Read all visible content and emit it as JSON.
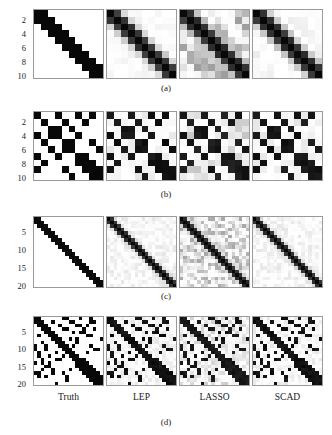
{
  "figure": {
    "title": "",
    "background": "#ffffff",
    "panel_border_color": "#9a9a9a",
    "columns": [
      {
        "id": "truth",
        "label": "Truth"
      },
      {
        "id": "lep",
        "label": "LEP"
      },
      {
        "id": "lasso",
        "label": "LASSO"
      },
      {
        "id": "scad",
        "label": "SCAD"
      }
    ],
    "rows": [
      {
        "id": "a",
        "caption": "(a)",
        "size": 10,
        "yticks": [
          "2",
          "4",
          "6",
          "8",
          "10"
        ],
        "ytickvals": [
          2,
          4,
          6,
          8,
          10
        ]
      },
      {
        "id": "b",
        "caption": "(b)",
        "size": 10,
        "yticks": [
          "2",
          "4",
          "6",
          "8",
          "10"
        ],
        "ytickvals": [
          2,
          4,
          6,
          8,
          10
        ]
      },
      {
        "id": "c",
        "caption": "(c)",
        "size": 20,
        "yticks": [
          "5",
          "10",
          "15",
          "20"
        ],
        "ytickvals": [
          5,
          10,
          15,
          20
        ]
      },
      {
        "id": "d",
        "caption": "(d)",
        "size": 20,
        "yticks": [
          "5",
          "10",
          "15",
          "20"
        ],
        "ytickvals": [
          5,
          10,
          15,
          20
        ]
      }
    ]
  },
  "chart_data": {
    "type": "heatmap",
    "title": "",
    "xlabel": "",
    "ylabel": "",
    "colormap": "grayscale_reversed",
    "value_range": [
      0,
      1
    ],
    "grids": [
      {
        "row": "a",
        "size": 10,
        "structure": "banded_tridiagonal",
        "panels": [
          {
            "column": "Truth",
            "diag": 1.0,
            "offdiag1": 1.0,
            "offdiag2": 0.0,
            "noise": 0.0,
            "noise_max": 0.0
          },
          {
            "column": "LEP",
            "diag": 1.0,
            "offdiag1": 0.78,
            "offdiag2": 0.18,
            "noise": 0.03,
            "noise_max": 0.1
          },
          {
            "column": "LASSO",
            "diag": 1.0,
            "offdiag1": 0.8,
            "offdiag2": 0.25,
            "noise": 0.22,
            "noise_max": 0.38
          },
          {
            "column": "SCAD",
            "diag": 1.0,
            "offdiag1": 0.8,
            "offdiag2": 0.2,
            "noise": 0.04,
            "noise_max": 0.12
          }
        ]
      },
      {
        "row": "b",
        "size": 10,
        "structure": "sparse_random_symmetric",
        "nonzeros": [
          [
            0,
            0
          ],
          [
            0,
            3
          ],
          [
            0,
            6
          ],
          [
            0,
            8
          ],
          [
            1,
            1
          ],
          [
            1,
            4
          ],
          [
            1,
            7
          ],
          [
            2,
            2
          ],
          [
            2,
            3
          ],
          [
            2,
            5
          ],
          [
            3,
            0
          ],
          [
            3,
            2
          ],
          [
            3,
            3
          ],
          [
            3,
            6
          ],
          [
            4,
            1
          ],
          [
            4,
            4
          ],
          [
            4,
            5
          ],
          [
            4,
            8
          ],
          [
            5,
            2
          ],
          [
            5,
            4
          ],
          [
            5,
            5
          ],
          [
            5,
            9
          ],
          [
            6,
            0
          ],
          [
            6,
            3
          ],
          [
            6,
            6
          ],
          [
            6,
            7
          ],
          [
            7,
            1
          ],
          [
            7,
            6
          ],
          [
            7,
            7
          ],
          [
            7,
            8
          ],
          [
            8,
            0
          ],
          [
            8,
            4
          ],
          [
            8,
            7
          ],
          [
            8,
            8
          ],
          [
            8,
            9
          ],
          [
            9,
            5
          ],
          [
            9,
            8
          ],
          [
            9,
            9
          ]
        ],
        "panels": [
          {
            "column": "Truth",
            "value": 1.0,
            "noise": 0.0,
            "noise_max": 0.0
          },
          {
            "column": "LEP",
            "value": 0.92,
            "noise": 0.05,
            "noise_max": 0.16
          },
          {
            "column": "LASSO",
            "value": 0.9,
            "noise": 0.12,
            "noise_max": 0.28
          },
          {
            "column": "SCAD",
            "value": 0.92,
            "noise": 0.05,
            "noise_max": 0.16
          }
        ]
      },
      {
        "row": "c",
        "size": 20,
        "structure": "banded_tridiagonal",
        "panels": [
          {
            "column": "Truth",
            "diag": 1.0,
            "offdiag1": 0.95,
            "offdiag2": 0.0,
            "noise": 0.0,
            "noise_max": 0.0
          },
          {
            "column": "LEP",
            "diag": 1.0,
            "offdiag1": 0.8,
            "offdiag2": 0.12,
            "noise": 0.05,
            "noise_max": 0.14
          },
          {
            "column": "LASSO",
            "diag": 1.0,
            "offdiag1": 0.82,
            "offdiag2": 0.16,
            "noise": 0.18,
            "noise_max": 0.34
          },
          {
            "column": "SCAD",
            "diag": 1.0,
            "offdiag1": 0.8,
            "offdiag2": 0.12,
            "noise": 0.05,
            "noise_max": 0.14
          }
        ]
      },
      {
        "row": "d",
        "size": 20,
        "structure": "antidiagonal_plus_sparse",
        "nonzeros": [
          [
            0,
            0
          ],
          [
            0,
            1
          ],
          [
            0,
            9
          ],
          [
            0,
            13
          ],
          [
            0,
            16
          ],
          [
            1,
            0
          ],
          [
            1,
            1
          ],
          [
            1,
            2
          ],
          [
            1,
            11
          ],
          [
            1,
            17
          ],
          [
            2,
            1
          ],
          [
            2,
            2
          ],
          [
            2,
            3
          ],
          [
            2,
            12
          ],
          [
            2,
            15
          ],
          [
            3,
            2
          ],
          [
            3,
            3
          ],
          [
            3,
            4
          ],
          [
            3,
            8
          ],
          [
            3,
            14
          ],
          [
            4,
            3
          ],
          [
            4,
            4
          ],
          [
            4,
            5
          ],
          [
            4,
            13
          ],
          [
            4,
            14
          ],
          [
            5,
            1
          ],
          [
            5,
            4
          ],
          [
            5,
            5
          ],
          [
            5,
            6
          ],
          [
            5,
            16
          ],
          [
            6,
            5
          ],
          [
            6,
            6
          ],
          [
            6,
            7
          ],
          [
            6,
            10
          ],
          [
            7,
            2
          ],
          [
            7,
            6
          ],
          [
            7,
            7
          ],
          [
            7,
            8
          ],
          [
            7,
            12
          ],
          [
            8,
            0
          ],
          [
            8,
            7
          ],
          [
            8,
            8
          ],
          [
            8,
            9
          ],
          [
            8,
            11
          ],
          [
            9,
            3
          ],
          [
            9,
            8
          ],
          [
            9,
            9
          ],
          [
            9,
            10
          ],
          [
            9,
            17
          ],
          [
            10,
            1
          ],
          [
            10,
            9
          ],
          [
            10,
            10
          ],
          [
            10,
            11
          ],
          [
            10,
            15
          ],
          [
            11,
            4
          ],
          [
            11,
            10
          ],
          [
            11,
            11
          ],
          [
            11,
            12
          ],
          [
            12,
            6
          ],
          [
            12,
            11
          ],
          [
            12,
            12
          ],
          [
            12,
            13
          ],
          [
            12,
            14
          ],
          [
            13,
            2
          ],
          [
            13,
            12
          ],
          [
            13,
            13
          ],
          [
            13,
            14
          ],
          [
            13,
            15
          ],
          [
            14,
            12
          ],
          [
            14,
            13
          ],
          [
            14,
            14
          ],
          [
            14,
            15
          ],
          [
            14,
            16
          ],
          [
            15,
            5
          ],
          [
            15,
            13
          ],
          [
            15,
            14
          ],
          [
            15,
            15
          ],
          [
            15,
            16
          ],
          [
            16,
            1
          ],
          [
            16,
            8
          ],
          [
            16,
            14
          ],
          [
            16,
            15
          ],
          [
            16,
            16
          ],
          [
            16,
            17
          ],
          [
            17,
            3
          ],
          [
            17,
            15
          ],
          [
            17,
            16
          ],
          [
            17,
            17
          ],
          [
            17,
            18
          ],
          [
            18,
            9
          ],
          [
            18,
            16
          ],
          [
            18,
            17
          ],
          [
            18,
            18
          ],
          [
            18,
            19
          ],
          [
            19,
            6
          ],
          [
            19,
            17
          ],
          [
            19,
            18
          ],
          [
            19,
            19
          ]
        ],
        "panels": [
          {
            "column": "Truth",
            "value": 1.0,
            "noise": 0.0,
            "noise_max": 0.0
          },
          {
            "column": "LEP",
            "value": 0.93,
            "noise": 0.05,
            "noise_max": 0.14
          },
          {
            "column": "LASSO",
            "value": 0.91,
            "noise": 0.1,
            "noise_max": 0.24
          },
          {
            "column": "SCAD",
            "value": 0.93,
            "noise": 0.05,
            "noise_max": 0.14
          }
        ]
      }
    ]
  },
  "layout": {
    "panel_lefts": [
      0,
      73,
      146,
      219
    ],
    "panel_width": 71,
    "row_tops": [
      9,
      111,
      216,
      316
    ],
    "row_heights": [
      70,
      70,
      72,
      70
    ],
    "caption_tops": [
      83,
      189,
      291,
      417
    ],
    "collabel_top": 392
  }
}
